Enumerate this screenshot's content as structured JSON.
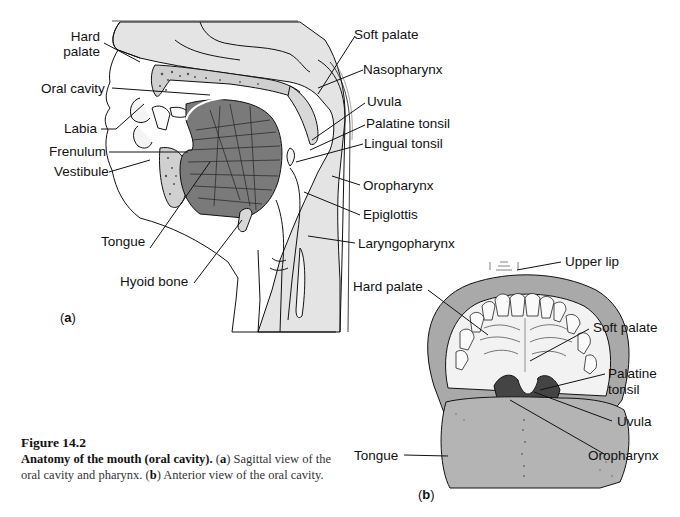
{
  "figure": {
    "number": "Figure 14.2",
    "title": "Anatomy of the mouth (oral cavity).",
    "caption_parts": {
      "a_tag": "a",
      "a_text": " Sagittal view of the oral cavity and pharynx. ",
      "b_tag": "b",
      "b_text": " Anterior view of the oral cavity."
    }
  },
  "panel_a": {
    "tag": "a",
    "labels_left": {
      "hard_palate_1": "Hard",
      "hard_palate_2": "palate",
      "oral_cavity": "Oral cavity",
      "labia": "Labia",
      "frenulum": "Frenulum",
      "vestibule": "Vestibule",
      "tongue": "Tongue",
      "hyoid_bone": "Hyoid bone"
    },
    "labels_right": {
      "soft_palate": "Soft palate",
      "nasopharynx": "Nasopharynx",
      "uvula": "Uvula",
      "palatine_tonsil": "Palatine tonsil",
      "lingual_tonsil": "Lingual tonsil",
      "oropharynx": "Oropharynx",
      "epiglottis": "Epiglottis",
      "laryngopharynx": "Laryngopharynx"
    }
  },
  "panel_b": {
    "tag": "b",
    "labels": {
      "upper_lip": "Upper lip",
      "hard_palate": "Hard palate",
      "soft_palate": "Soft palate",
      "palatine_tonsil_1": "Palatine",
      "palatine_tonsil_2": "tonsil",
      "uvula": "Uvula",
      "tongue": "Tongue",
      "oropharynx": "Oropharynx"
    }
  },
  "colors": {
    "tissue_fill": "#e4e4e4",
    "lip_fill": "#a9a9a9",
    "tongue_fill": "#b4b4b4",
    "throat_dark": "#444444",
    "ink": "#111111"
  }
}
